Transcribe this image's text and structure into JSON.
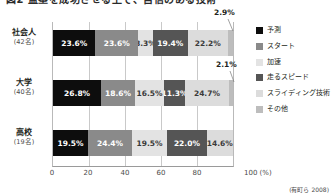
{
  "title": "図2 盗塁を成功させる上で、自信のある技術",
  "source_note": "(有町ら 2008)",
  "axis": {
    "unit_label": "100 (%)",
    "ticks": [
      "0",
      "20",
      "40",
      "60",
      "80"
    ],
    "max": 100
  },
  "legend": {
    "items": [
      {
        "label": "予測",
        "color": "#0d0d0d"
      },
      {
        "label": "スタート",
        "color": "#8a8a8a"
      },
      {
        "label": "加速",
        "color": "#e3e3e3"
      },
      {
        "label": "走るスピード",
        "color": "#555555"
      },
      {
        "label": "スライディング技術",
        "color": "#dcdcdc"
      },
      {
        "label": "その他",
        "color": "#bdbdbd"
      }
    ]
  },
  "rows": [
    {
      "name": "社会人",
      "count": "(42名)",
      "callout": "2.9%"
    },
    {
      "name": "大学",
      "count": "(40名)",
      "callout": "2.1%"
    },
    {
      "name": "高校",
      "count": "(19名)",
      "callout": ""
    }
  ],
  "chart_data": {
    "type": "bar",
    "orientation": "horizontal",
    "stacked": true,
    "stacked_percent": true,
    "title": "図2 盗塁を成功させる上で、自信のある技術",
    "xlabel": "100 (%)",
    "ylabel": "",
    "xlim": [
      0,
      100
    ],
    "xticks": [
      0,
      20,
      40,
      60,
      80,
      100
    ],
    "grid": true,
    "legend_position": "right",
    "categories": [
      "社会人 (42名)",
      "大学 (40名)",
      "高校 (19名)"
    ],
    "series": [
      {
        "name": "予測",
        "color": "#0d0d0d",
        "values": [
          23.6,
          26.8,
          19.5
        ]
      },
      {
        "name": "スタート",
        "color": "#8a8a8a",
        "values": [
          23.6,
          18.6,
          24.4
        ]
      },
      {
        "name": "加速",
        "color": "#e3e3e3",
        "values": [
          8.3,
          16.5,
          19.5
        ]
      },
      {
        "name": "走るスピード",
        "color": "#555555",
        "values": [
          19.4,
          11.3,
          22.0
        ]
      },
      {
        "name": "スライディング技術",
        "color": "#dcdcdc",
        "values": [
          22.2,
          24.7,
          14.6
        ]
      },
      {
        "name": "その他",
        "color": "#bdbdbd",
        "values": [
          2.9,
          2.1,
          0
        ]
      }
    ],
    "data_labels": {
      "社会人 (42名)": [
        "23.6%",
        "23.6%",
        "8.3%",
        "19.4%",
        "22.2%",
        "2.9%"
      ],
      "大学 (40名)": [
        "26.8%",
        "18.6%",
        "16.5%",
        "11.3%",
        "24.7%",
        "2.1%"
      ],
      "高校 (19名)": [
        "19.5%",
        "24.4%",
        "19.5%",
        "22.0%",
        "14.6%",
        ""
      ]
    },
    "annotations": [
      "2.9%",
      "2.1%"
    ],
    "source": "(有町ら 2008)"
  }
}
